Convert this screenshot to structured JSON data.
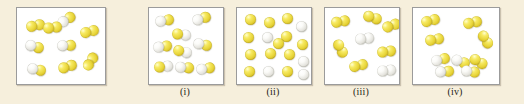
{
  "figure": {
    "type": "molecular-diagram",
    "background_color": "#f6efdc",
    "panel_background": "#ffffff",
    "panel_border_color": "#9b9b9b",
    "atom_colors": {
      "yellow": "#e8d53a",
      "white": "#e6e5df"
    },
    "atom_diameter_px": 11
  },
  "labels": {
    "reactant": "",
    "i": "(i)",
    "ii": "(ii)",
    "iii": "(iii)",
    "iv": "(iv)"
  },
  "panels": [
    {
      "id": "reactant",
      "label": "",
      "x": 16,
      "y": 7,
      "w": 88,
      "h": 76,
      "counts": {
        "yellow_yellow": 5,
        "white_yellow": 4,
        "white_white": 0,
        "single_yellow": 0,
        "single_white": 0
      },
      "molecules": [
        {
          "type": "yellow-yellow",
          "x": 9,
          "y": 12,
          "rot": -12
        },
        {
          "type": "white-yellow",
          "x": 40,
          "y": 6,
          "rot": -32
        },
        {
          "type": "yellow-yellow",
          "x": 63,
          "y": 18,
          "rot": -14
        },
        {
          "type": "white-yellow",
          "x": 8,
          "y": 33,
          "rot": 16
        },
        {
          "type": "white-yellow",
          "x": 40,
          "y": 32,
          "rot": -2
        },
        {
          "type": "white-yellow",
          "x": 10,
          "y": 56,
          "rot": 12
        },
        {
          "type": "yellow-yellow",
          "x": 41,
          "y": 53,
          "rot": -18
        },
        {
          "type": "yellow-yellow",
          "x": 64,
          "y": 48,
          "rot": -58
        },
        {
          "type": "yellow-yellow",
          "x": 26,
          "y": 14,
          "rot": -6
        }
      ]
    },
    {
      "id": "i",
      "label": "(i)",
      "x": 148,
      "y": 7,
      "w": 74,
      "h": 76,
      "counts": {
        "yellow_yellow": 0,
        "white_yellow": 9,
        "white_white": 0,
        "single_yellow": 0,
        "single_white": 0
      },
      "molecules": [
        {
          "type": "white-yellow",
          "x": 6,
          "y": 7,
          "rot": -10
        },
        {
          "type": "white-yellow",
          "x": 43,
          "y": 5,
          "rot": -18
        },
        {
          "type": "yellow-white",
          "x": 23,
          "y": 21,
          "rot": 8
        },
        {
          "type": "white-yellow",
          "x": 4,
          "y": 33,
          "rot": -8
        },
        {
          "type": "white-yellow",
          "x": 44,
          "y": 31,
          "rot": 12
        },
        {
          "type": "yellow-white",
          "x": 5,
          "y": 53,
          "rot": -6
        },
        {
          "type": "white-yellow",
          "x": 26,
          "y": 54,
          "rot": 4
        },
        {
          "type": "white-yellow",
          "x": 47,
          "y": 55,
          "rot": -10
        },
        {
          "type": "yellow-white",
          "x": 24,
          "y": 38,
          "rot": 14
        }
      ]
    },
    {
      "id": "ii",
      "label": "(ii)",
      "x": 236,
      "y": 7,
      "w": 74,
      "h": 76,
      "counts": {
        "yellow_yellow": 0,
        "white_yellow": 0,
        "white_white": 0,
        "single_yellow": 12,
        "single_white": 5
      },
      "molecules": [
        {
          "type": "atom-yellow",
          "x": 8,
          "y": 6
        },
        {
          "type": "atom-yellow",
          "x": 27,
          "y": 9
        },
        {
          "type": "atom-yellow",
          "x": 45,
          "y": 5
        },
        {
          "type": "atom-white",
          "x": 59,
          "y": 13
        },
        {
          "type": "atom-yellow",
          "x": 6,
          "y": 24
        },
        {
          "type": "atom-white",
          "x": 25,
          "y": 24
        },
        {
          "type": "atom-yellow",
          "x": 44,
          "y": 23
        },
        {
          "type": "atom-yellow",
          "x": 60,
          "y": 31
        },
        {
          "type": "atom-yellow",
          "x": 8,
          "y": 41
        },
        {
          "type": "atom-yellow",
          "x": 28,
          "y": 40
        },
        {
          "type": "atom-yellow",
          "x": 47,
          "y": 41
        },
        {
          "type": "atom-white",
          "x": 61,
          "y": 48
        },
        {
          "type": "atom-yellow",
          "x": 7,
          "y": 58
        },
        {
          "type": "atom-white",
          "x": 26,
          "y": 58
        },
        {
          "type": "atom-yellow",
          "x": 45,
          "y": 58
        },
        {
          "type": "atom-white",
          "x": 61,
          "y": 61
        },
        {
          "type": "atom-yellow",
          "x": 36,
          "y": 30
        }
      ]
    },
    {
      "id": "iii",
      "label": "(iii)",
      "x": 324,
      "y": 7,
      "w": 74,
      "h": 76,
      "counts": {
        "yellow_yellow": 5,
        "white_yellow": 0,
        "white_white": 2,
        "single_yellow": 0,
        "single_white": 0
      },
      "molecules": [
        {
          "type": "yellow-yellow",
          "x": 6,
          "y": 8,
          "rot": -10
        },
        {
          "type": "yellow-yellow",
          "x": 38,
          "y": 4,
          "rot": 18
        },
        {
          "type": "yellow-yellow",
          "x": 57,
          "y": 12,
          "rot": -20
        },
        {
          "type": "white-white",
          "x": 30,
          "y": 25,
          "rot": -6
        },
        {
          "type": "yellow-yellow",
          "x": 6,
          "y": 35,
          "rot": 62
        },
        {
          "type": "yellow-yellow",
          "x": 52,
          "y": 38,
          "rot": -8
        },
        {
          "type": "yellow-yellow",
          "x": 24,
          "y": 52,
          "rot": -14
        },
        {
          "type": "white-white",
          "x": 52,
          "y": 57,
          "rot": -6
        }
      ]
    },
    {
      "id": "iv",
      "label": "(iv)",
      "x": 412,
      "y": 7,
      "w": 86,
      "h": 76,
      "counts": {
        "yellow_yellow": 5,
        "white_yellow": 4,
        "white_white": 0,
        "single_yellow": 0,
        "single_white": 0
      },
      "molecules": [
        {
          "type": "yellow-yellow",
          "x": 8,
          "y": 7,
          "rot": -14
        },
        {
          "type": "yellow-yellow",
          "x": 50,
          "y": 9,
          "rot": -12
        },
        {
          "type": "yellow-yellow",
          "x": 12,
          "y": 26,
          "rot": -10
        },
        {
          "type": "yellow-yellow",
          "x": 63,
          "y": 26,
          "rot": 58
        },
        {
          "type": "white-yellow",
          "x": 18,
          "y": 46,
          "rot": -14
        },
        {
          "type": "white-yellow",
          "x": 38,
          "y": 48,
          "rot": 20
        },
        {
          "type": "white-yellow",
          "x": 22,
          "y": 58,
          "rot": -4
        },
        {
          "type": "white-yellow",
          "x": 48,
          "y": 58,
          "rot": 8
        },
        {
          "type": "yellow-yellow",
          "x": 56,
          "y": 48,
          "rot": 30
        }
      ]
    }
  ]
}
